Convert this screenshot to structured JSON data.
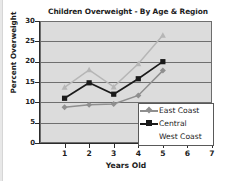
{
  "chart_data": {
    "type": "line",
    "title": "Children Overweight - By Age & Region",
    "xlabel": "Years Old",
    "ylabel": "Percent Overweight",
    "x": [
      1,
      2,
      3,
      4,
      5
    ],
    "categories": [
      "1",
      "2",
      "3",
      "4",
      "5"
    ],
    "xlim": [
      0,
      7
    ],
    "ylim": [
      0,
      30
    ],
    "x_ticks": [
      "1",
      "2",
      "3",
      "4",
      "5",
      "6",
      "7"
    ],
    "y_ticks": [
      "0",
      "5",
      "10",
      "15",
      "20",
      "25",
      "30"
    ],
    "grid": "horizontal",
    "legend_position": "inside-bottom-right",
    "plot_background": "#dcdcdc",
    "series": [
      {
        "name": "East Coast",
        "values": [
          8.8,
          9.4,
          9.6,
          11.7,
          17.8
        ],
        "color": "#8f8f8f",
        "marker": "diamond"
      },
      {
        "name": "Central",
        "values": [
          11.0,
          14.8,
          12.0,
          15.8,
          20.0
        ],
        "color": "#1a1a1a",
        "marker": "square"
      },
      {
        "name": "West Coast",
        "values": [
          13.7,
          18.0,
          13.8,
          19.5,
          26.5
        ],
        "color": "#b6b6b6",
        "marker": "triangle"
      }
    ]
  },
  "legend": {
    "entries": [
      "East Coast",
      "Central",
      "West Coast"
    ]
  }
}
